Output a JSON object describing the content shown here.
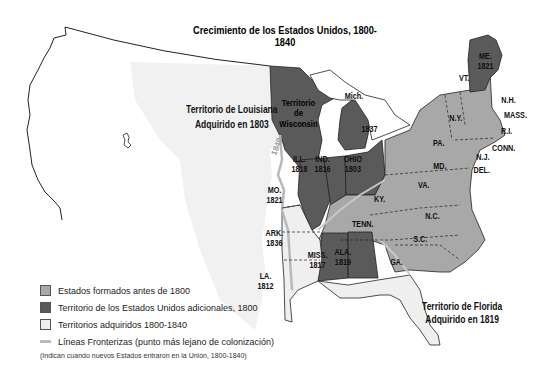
{
  "title": "Crecimiento de los Estados Unidos, 1800-1840",
  "colors": {
    "states_before_1800": "#a8a8a8",
    "us_territory_1800": "#5a5a5a",
    "acquired_1800_1840": "#efefef",
    "frontier_line": "#b8b8b8",
    "border": "#222222"
  },
  "regions": {
    "louisiana": {
      "line1": "Territorio de Louisiana",
      "line2": "Adquirido en 1803"
    },
    "florida": {
      "line1": "Territorio de Florida",
      "line2": "Adquirido en 1819"
    },
    "wisconsin": {
      "line1": "Territorio",
      "line2": "de",
      "line3": "Wisconsin"
    },
    "mich": {
      "name": "Mich.",
      "year": "1837"
    }
  },
  "states": {
    "me": {
      "name": "ME.",
      "year": "1821"
    },
    "vt": {
      "name": "VT."
    },
    "nh": {
      "name": "N.H."
    },
    "mass": {
      "name": "MASS."
    },
    "ri": {
      "name": "R.I."
    },
    "conn": {
      "name": "CONN."
    },
    "ny": {
      "name": "N.Y."
    },
    "pa": {
      "name": "PA."
    },
    "nj": {
      "name": "N.J."
    },
    "md": {
      "name": "MD."
    },
    "del": {
      "name": "DEL."
    },
    "va": {
      "name": "VA."
    },
    "nc": {
      "name": "N.C."
    },
    "sc": {
      "name": "S.C."
    },
    "ga": {
      "name": "GA."
    },
    "ky": {
      "name": "KY."
    },
    "tenn": {
      "name": "TENN."
    },
    "ohio": {
      "name": "OHIO",
      "year": "1803"
    },
    "ind": {
      "name": "IND.",
      "year": "1816"
    },
    "ill": {
      "name": "ILL.",
      "year": "1818"
    },
    "mo": {
      "name": "MO.",
      "year": "1821"
    },
    "ark": {
      "name": "ARK.",
      "year": "1836"
    },
    "la": {
      "name": "LA.",
      "year": "1812"
    },
    "miss": {
      "name": "MISS.",
      "year": "1817"
    },
    "ala": {
      "name": "ALA.",
      "year": "1819"
    }
  },
  "frontier_label": "1840",
  "legend": {
    "items": [
      {
        "label": "Estados formados antes de 1800"
      },
      {
        "label": "Territorio de los Estados Unidos adicionales, 1800"
      },
      {
        "label": "Territorios adquiridos 1800-1840"
      },
      {
        "label": "Líneas Fronterizas (punto más lejano de colonización)"
      }
    ],
    "note": "(Indican cuando nuevos Estados entraron en la Unión, 1800-1840)"
  }
}
